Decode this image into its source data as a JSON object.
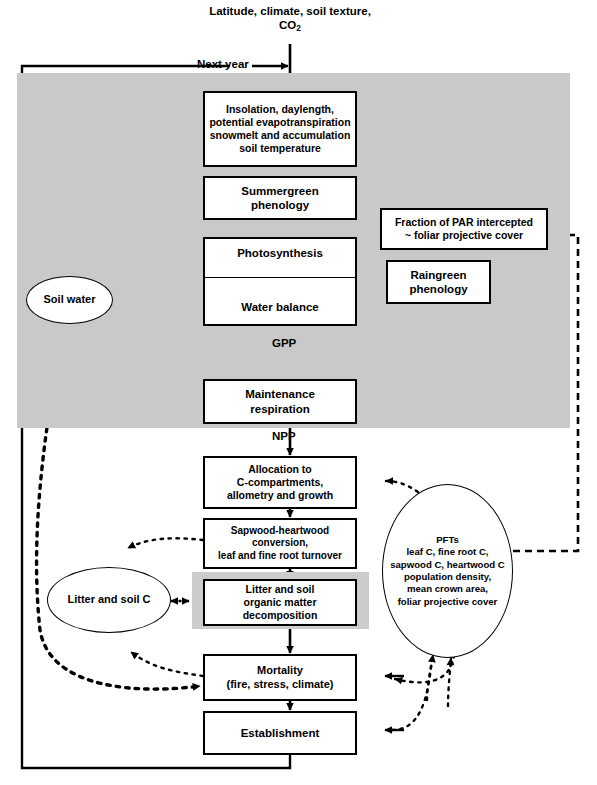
{
  "diagram": {
    "colors": {
      "band_gray": "#c9c9c9",
      "box_gray": "#cccccc",
      "stroke": "#000000",
      "fill": "#ffffff"
    }
  },
  "inputs": {
    "driver_line1": "Latitude, climate,",
    "driver_line2_pre": "soil texture, CO",
    "driver_line2_sub": "2",
    "next_year_label": "Next year"
  },
  "nodes": {
    "insolation": {
      "lines": [
        "Insolation, daylength,",
        "potential evapotranspiration",
        "snowmelt and accumulation",
        "soil temperature"
      ]
    },
    "summergreen": {
      "lines": [
        "Summergreen",
        "phenology"
      ]
    },
    "fpar": {
      "lines": [
        "Fraction of PAR intercepted",
        "~ foliar projective cover"
      ]
    },
    "photosynthesis": {
      "lines": [
        "Photosynthesis"
      ]
    },
    "water_balance": {
      "lines": [
        "Water balance"
      ]
    },
    "raingreen": {
      "lines": [
        "Raingreen",
        "phenology"
      ]
    },
    "soil_water": {
      "lines": [
        "Soil water"
      ]
    },
    "maintenance": {
      "lines": [
        "Maintenance",
        "respiration"
      ]
    },
    "allocation": {
      "lines": [
        "Allocation to",
        "C-compartments,",
        "allometry and growth"
      ]
    },
    "sapwood": {
      "lines": [
        "Sapwood-heartwood",
        "conversion,",
        "leaf and fine root turnover"
      ]
    },
    "litter_decomp": {
      "lines": [
        "Litter and soil",
        "organic matter",
        "decomposition"
      ]
    },
    "litter_soil_c": {
      "lines": [
        "Litter and soil C"
      ]
    },
    "mortality": {
      "lines": [
        "Mortality",
        "(fire, stress, climate)"
      ]
    },
    "establishment": {
      "lines": [
        "Establishment"
      ]
    },
    "pfts": {
      "lines": [
        "PFTs",
        "leaf C, fine root C,",
        "sapwood C, heartwood C",
        "population density,",
        "mean crown area,",
        "foliar projective cover"
      ]
    }
  },
  "edge_labels": {
    "gpp": "GPP",
    "npp": "NPP"
  }
}
